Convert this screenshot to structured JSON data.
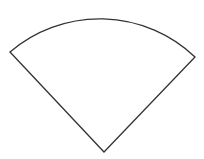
{
  "figure": {
    "shape": "circular-sector",
    "stroke_color": "#333333",
    "fill_color": "#ffffff",
    "apex": [
      104,
      152
    ],
    "left_point": [
      10,
      52
    ],
    "right_point": [
      195,
      57
    ],
    "radius": 138
  }
}
